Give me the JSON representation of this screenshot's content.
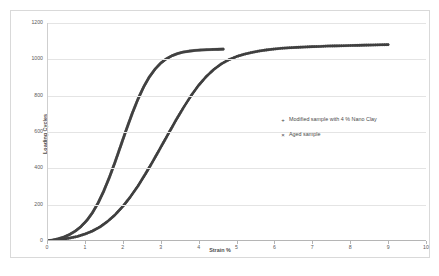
{
  "chart_data": {
    "type": "scatter",
    "title": "",
    "xlabel": "Strain %",
    "ylabel": "Loading Cycles",
    "xlim": [
      0,
      10
    ],
    "ylim": [
      0,
      1200
    ],
    "xticks": [
      "0",
      "1",
      "2",
      "3",
      "4",
      "5",
      "6",
      "7",
      "8",
      "9",
      "10"
    ],
    "yticks": [
      "0",
      "200",
      "400",
      "600",
      "800",
      "1000",
      "1200"
    ],
    "grid": "horizontal",
    "legend_position": "center-right-inside",
    "series": [
      {
        "name": "Modified sample with 4 % Nano Clay",
        "marker": "+",
        "color": "#404040",
        "x": [
          0.0,
          0.2,
          0.4,
          0.6,
          0.8,
          1.0,
          1.2,
          1.4,
          1.6,
          1.8,
          2.0,
          2.2,
          2.4,
          2.6,
          2.8,
          3.0,
          3.2,
          3.4,
          3.6,
          3.8,
          4.0,
          4.2,
          4.4,
          4.6,
          4.8,
          5.0,
          5.2,
          5.4,
          5.6,
          5.8,
          6.0,
          6.2,
          6.4,
          6.6,
          6.8,
          7.0,
          7.2,
          7.4,
          7.6,
          7.8,
          8.0,
          8.2,
          8.4,
          8.6,
          8.8,
          9.0
        ],
        "y": [
          0,
          4,
          9,
          16,
          25,
          38,
          55,
          78,
          108,
          145,
          190,
          243,
          303,
          370,
          441,
          515,
          590,
          664,
          734,
          799,
          857,
          905,
          944,
          975,
          998,
          1015,
          1028,
          1038,
          1046,
          1052,
          1057,
          1061,
          1064,
          1066,
          1068,
          1070,
          1071,
          1073,
          1074,
          1075,
          1076,
          1077,
          1078,
          1079,
          1080,
          1081
        ]
      },
      {
        "name": "Aged sample",
        "marker": "x",
        "color": "#434343",
        "x": [
          0.0,
          0.15,
          0.3,
          0.45,
          0.6,
          0.75,
          0.9,
          1.05,
          1.2,
          1.35,
          1.5,
          1.65,
          1.8,
          1.95,
          2.1,
          2.25,
          2.4,
          2.55,
          2.7,
          2.85,
          3.0,
          3.15,
          3.3,
          3.45,
          3.6,
          3.75,
          3.9,
          4.05,
          4.2,
          4.35,
          4.5,
          4.65
        ],
        "y": [
          0,
          5,
          12,
          22,
          36,
          55,
          80,
          113,
          156,
          210,
          276,
          352,
          437,
          527,
          617,
          703,
          781,
          848,
          903,
          946,
          979,
          1003,
          1020,
          1032,
          1040,
          1045,
          1049,
          1051,
          1053,
          1054,
          1055,
          1056
        ]
      }
    ]
  },
  "legend": {
    "items": [
      {
        "marker": "+",
        "label": "Modified sample with 4 % Nano Clay"
      },
      {
        "marker": "×",
        "label": "Aged sample"
      }
    ]
  }
}
